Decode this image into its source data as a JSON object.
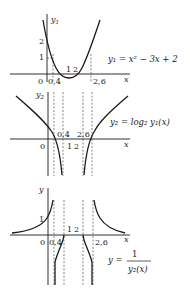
{
  "figure": {
    "panel1": {
      "y_label": "y",
      "y_label_sub": "1",
      "x_label": "x",
      "equation": "y₁ = x² − 3x + 2",
      "tick_labels": {
        "origin": "0",
        "x_04": "0,4",
        "x_1": "1",
        "x_2": "2",
        "x_26": "2,6",
        "y_1": "1",
        "y_2": "2"
      }
    },
    "panel2": {
      "y_label": "y",
      "y_label_sub": "2",
      "x_label": "x",
      "equation": "y₂ = log₂ y₁(x)",
      "tick_labels": {
        "origin": "0",
        "x_04": "0,4",
        "x_1": "1",
        "x_2": "2",
        "x_26": "2,6"
      }
    },
    "panel3": {
      "y_label": "y",
      "x_label": "x",
      "equation_lhs": "y =",
      "equation_num": "1",
      "equation_den": "y₂(x)",
      "tick_labels": {
        "origin": "0",
        "x_04": "0,4",
        "x_1": "1",
        "x_2": "2",
        "x_26": "2,6",
        "y_1": "1"
      }
    }
  }
}
